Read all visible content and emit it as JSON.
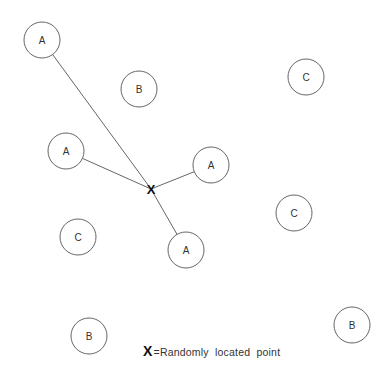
{
  "diagram": {
    "point": {
      "label": "X",
      "x": 151,
      "y": 189
    },
    "circles": [
      {
        "label": "A",
        "x": 42,
        "y": 40,
        "r": 18,
        "connected": true
      },
      {
        "label": "B",
        "x": 139,
        "y": 89,
        "r": 18,
        "connected": false
      },
      {
        "label": "C",
        "x": 306,
        "y": 77,
        "r": 18,
        "connected": false
      },
      {
        "label": "A",
        "x": 66,
        "y": 151,
        "r": 18,
        "connected": true
      },
      {
        "label": "A",
        "x": 211,
        "y": 165,
        "r": 18,
        "connected": true
      },
      {
        "label": "C",
        "x": 294,
        "y": 213,
        "r": 18,
        "connected": false
      },
      {
        "label": "C",
        "x": 78,
        "y": 237,
        "r": 18,
        "connected": false
      },
      {
        "label": "A",
        "x": 186,
        "y": 250,
        "r": 18,
        "connected": true
      },
      {
        "label": "B",
        "x": 89,
        "y": 336,
        "r": 18,
        "connected": false
      },
      {
        "label": "B",
        "x": 352,
        "y": 325,
        "r": 18,
        "connected": false
      }
    ]
  },
  "legend": {
    "symbol": "X",
    "text": "=Randomly  located  point"
  }
}
